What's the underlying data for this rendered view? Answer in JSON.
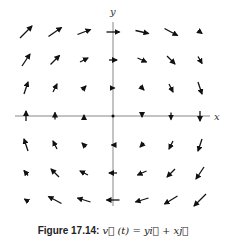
{
  "figure": {
    "caption_label": "Figure 17.14:",
    "caption_equation": "v⃗ (t) = yi⃗ + xj⃗",
    "x_axis_label": "x",
    "y_axis_label": "y",
    "axis_color": "#888888",
    "arrow_color": "#111111"
  },
  "axes": {
    "origin": [
      113,
      116
    ],
    "x_range": [
      15,
      210
    ],
    "y_range": [
      22,
      206
    ]
  },
  "grid": {
    "xs": [
      26,
      55,
      84,
      113,
      142,
      171,
      200
    ],
    "ys": [
      32,
      60,
      88,
      116,
      145,
      173,
      200
    ]
  },
  "arrows": [
    {
      "x": 26,
      "y": 32,
      "dx": 12,
      "dy": -12
    },
    {
      "x": 55,
      "y": 32,
      "dx": 13,
      "dy": -9
    },
    {
      "x": 84,
      "y": 32,
      "dx": 13,
      "dy": -5
    },
    {
      "x": 113,
      "y": 32,
      "dx": 13,
      "dy": 0
    },
    {
      "x": 142,
      "y": 32,
      "dx": 13,
      "dy": 3
    },
    {
      "x": 171,
      "y": 32,
      "dx": 13,
      "dy": 7
    },
    {
      "x": 200,
      "y": 32,
      "dx": 4,
      "dy": 3
    },
    {
      "x": 26,
      "y": 60,
      "dx": 8,
      "dy": -12
    },
    {
      "x": 55,
      "y": 60,
      "dx": 9,
      "dy": -9
    },
    {
      "x": 84,
      "y": 60,
      "dx": 8,
      "dy": -4
    },
    {
      "x": 113,
      "y": 60,
      "dx": 8,
      "dy": 0
    },
    {
      "x": 142,
      "y": 60,
      "dx": 9,
      "dy": 4
    },
    {
      "x": 171,
      "y": 60,
      "dx": 8,
      "dy": 8
    },
    {
      "x": 200,
      "y": 60,
      "dx": 4,
      "dy": 7
    },
    {
      "x": 26,
      "y": 88,
      "dx": 4,
      "dy": -12
    },
    {
      "x": 55,
      "y": 88,
      "dx": 4,
      "dy": -8
    },
    {
      "x": 84,
      "y": 88,
      "dx": 4,
      "dy": -4
    },
    {
      "x": 113,
      "y": 88,
      "dx": 3,
      "dy": 0
    },
    {
      "x": 142,
      "y": 88,
      "dx": 4,
      "dy": 4
    },
    {
      "x": 171,
      "y": 88,
      "dx": 4,
      "dy": 8
    },
    {
      "x": 200,
      "y": 88,
      "dx": 4,
      "dy": 12
    },
    {
      "x": 26,
      "y": 116,
      "dx": 0,
      "dy": -10
    },
    {
      "x": 55,
      "y": 116,
      "dx": 0,
      "dy": -7
    },
    {
      "x": 84,
      "y": 116,
      "dx": 0,
      "dy": -2
    },
    {
      "x": 113,
      "y": 116,
      "dx": 0,
      "dy": 0
    },
    {
      "x": 142,
      "y": 116,
      "dx": 0,
      "dy": 2
    },
    {
      "x": 171,
      "y": 116,
      "dx": 0,
      "dy": 7
    },
    {
      "x": 200,
      "y": 116,
      "dx": 0,
      "dy": 10
    },
    {
      "x": 26,
      "y": 145,
      "dx": -4,
      "dy": -12
    },
    {
      "x": 55,
      "y": 145,
      "dx": -4,
      "dy": -8
    },
    {
      "x": 84,
      "y": 145,
      "dx": -4,
      "dy": -4
    },
    {
      "x": 113,
      "y": 145,
      "dx": -3,
      "dy": 0
    },
    {
      "x": 142,
      "y": 145,
      "dx": -4,
      "dy": 4
    },
    {
      "x": 171,
      "y": 145,
      "dx": -4,
      "dy": 8
    },
    {
      "x": 200,
      "y": 145,
      "dx": -4,
      "dy": 12
    },
    {
      "x": 26,
      "y": 173,
      "dx": -4,
      "dy": -5
    },
    {
      "x": 55,
      "y": 173,
      "dx": -8,
      "dy": -8
    },
    {
      "x": 84,
      "y": 173,
      "dx": -8,
      "dy": -4
    },
    {
      "x": 113,
      "y": 173,
      "dx": -8,
      "dy": 0
    },
    {
      "x": 142,
      "y": 173,
      "dx": -9,
      "dy": 4
    },
    {
      "x": 171,
      "y": 173,
      "dx": -8,
      "dy": 8
    },
    {
      "x": 200,
      "y": 173,
      "dx": -8,
      "dy": 12
    },
    {
      "x": 26,
      "y": 200,
      "dx": -3,
      "dy": -2
    },
    {
      "x": 55,
      "y": 200,
      "dx": -13,
      "dy": -7
    },
    {
      "x": 84,
      "y": 200,
      "dx": -13,
      "dy": -4
    },
    {
      "x": 113,
      "y": 200,
      "dx": -13,
      "dy": 0
    },
    {
      "x": 142,
      "y": 200,
      "dx": -13,
      "dy": 4
    },
    {
      "x": 171,
      "y": 200,
      "dx": -13,
      "dy": 8
    },
    {
      "x": 200,
      "y": 200,
      "dx": -12,
      "dy": 12
    }
  ]
}
